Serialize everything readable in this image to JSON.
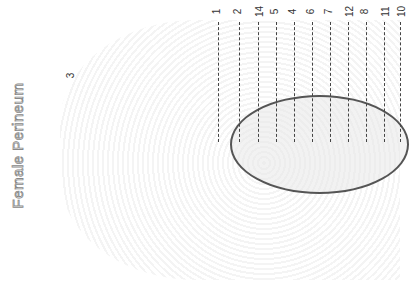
{
  "title": "Female Perineum",
  "labels": [
    {
      "id": "1",
      "x": 214,
      "y": 6
    },
    {
      "id": "2",
      "x": 235,
      "y": 6
    },
    {
      "id": "14",
      "x": 254,
      "y": 6
    },
    {
      "id": "5",
      "x": 272,
      "y": 6
    },
    {
      "id": "4",
      "x": 290,
      "y": 6
    },
    {
      "id": "6",
      "x": 308,
      "y": 6
    },
    {
      "id": "7",
      "x": 326,
      "y": 6
    },
    {
      "id": "12",
      "x": 344,
      "y": 6
    },
    {
      "id": "8",
      "x": 362,
      "y": 6
    },
    {
      "id": "11",
      "x": 380,
      "y": 6
    },
    {
      "id": "10",
      "x": 396,
      "y": 6
    },
    {
      "id": "3",
      "x": 68,
      "y": 70
    }
  ]
}
